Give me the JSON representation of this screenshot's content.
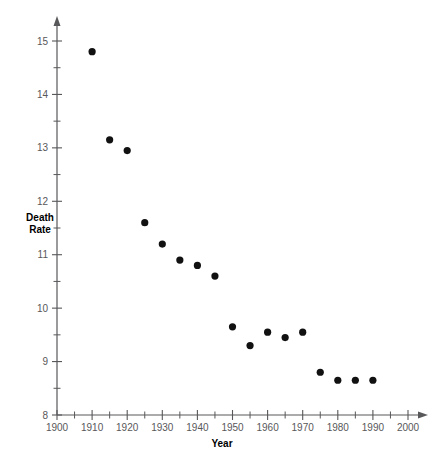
{
  "chart_data": {
    "type": "scatter",
    "title": "",
    "xlabel": "Year",
    "ylabel": "Death\nRate",
    "ylabel_line1": "Death",
    "ylabel_line2": "Rate",
    "x": [
      1910,
      1915,
      1920,
      1925,
      1930,
      1935,
      1940,
      1945,
      1950,
      1955,
      1960,
      1965,
      1970,
      1975,
      1980,
      1985,
      1990
    ],
    "values": [
      14.8,
      13.15,
      12.95,
      11.6,
      11.2,
      10.9,
      10.8,
      10.6,
      9.65,
      9.3,
      9.55,
      9.45,
      9.55,
      8.8,
      8.65,
      8.65,
      8.65
    ],
    "xlim": [
      1900,
      2000
    ],
    "ylim": [
      8,
      15
    ],
    "x_tick_step": 5,
    "x_label_step": 10,
    "y_tick_step": 0.5,
    "y_label_step": 1,
    "x_tick_labels": [
      "1900",
      "1910",
      "1920",
      "1930",
      "1940",
      "1950",
      "1960",
      "1970",
      "1980",
      "1990",
      "2000"
    ],
    "y_tick_labels": [
      "8",
      "9",
      "10",
      "11",
      "12",
      "13",
      "14",
      "15"
    ],
    "grid": false,
    "legend": null,
    "marker": "filled-circle",
    "marker_color": "#111111",
    "axis_color": "#58585a",
    "background": "#ffffff"
  }
}
